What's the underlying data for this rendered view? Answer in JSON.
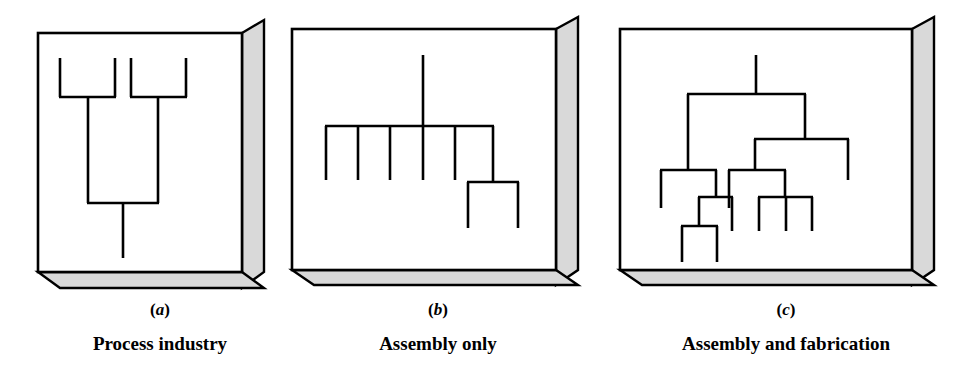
{
  "figure": {
    "background_color": "#ffffff",
    "line_color": "#000000",
    "box_face_color": "#ffffff",
    "box_shade_color": "#d9d9d9",
    "panel_count": 3
  },
  "panels": [
    {
      "letter": "a",
      "letter_open_paren": "(",
      "letter_close_paren": ")",
      "caption": "Process industry",
      "structure_type": "converging",
      "description": "Two separate sub-assemblies each converging into one trunk that ends in a single finished product",
      "nodes": {
        "top_legs": 4,
        "merge_levels": 2,
        "output_stems": 1
      }
    },
    {
      "letter": "b",
      "letter_open_paren": "(",
      "letter_close_paren": ")",
      "caption": "Assembly only",
      "structure_type": "flat-assembly",
      "description": "Single end item with one level of five components plus one component having two sub-components",
      "nodes": {
        "top_stems": 1,
        "first_level_legs": 5,
        "sub_assembly_legs": 2
      }
    },
    {
      "letter": "c",
      "letter_open_paren": "(",
      "letter_close_paren": ")",
      "caption": "Assembly and fabrication",
      "structure_type": "multi-level-tree",
      "description": "Single end item branching into multiple levels of assemblies, sub-assemblies and fabricated parts",
      "nodes": {
        "top_stems": 1,
        "level_1_branches": 2,
        "level_2_branches": 2,
        "level_3_branches": 4,
        "deepest_level": 4
      }
    }
  ]
}
